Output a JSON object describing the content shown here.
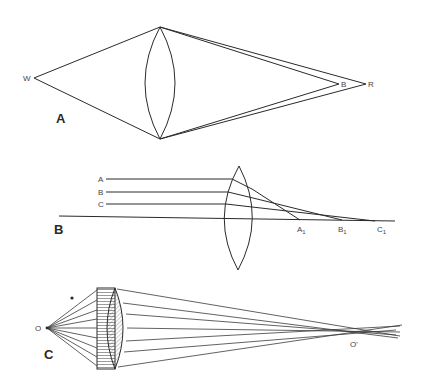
{
  "figure": {
    "panels": [
      {
        "id": "A",
        "label": "A",
        "description": "Chromatic aberration: white light from W focuses blue at B closer than red at R",
        "points": {
          "source": "W",
          "blue_focus": "B",
          "red_focus": "R"
        }
      },
      {
        "id": "B",
        "label": "B",
        "description": "Spherical aberration: parallel rays A, B, C focus at different points A1, B1, C1",
        "rays": [
          "A",
          "B",
          "C"
        ],
        "foci": [
          {
            "main": "A",
            "sub": "1"
          },
          {
            "main": "B",
            "sub": "1"
          },
          {
            "main": "C",
            "sub": "1"
          }
        ]
      },
      {
        "id": "C",
        "label": "C",
        "description": "Corrected lens with plate: rays from O converge at O'",
        "points": {
          "object": "O",
          "image": "O'"
        }
      }
    ]
  }
}
